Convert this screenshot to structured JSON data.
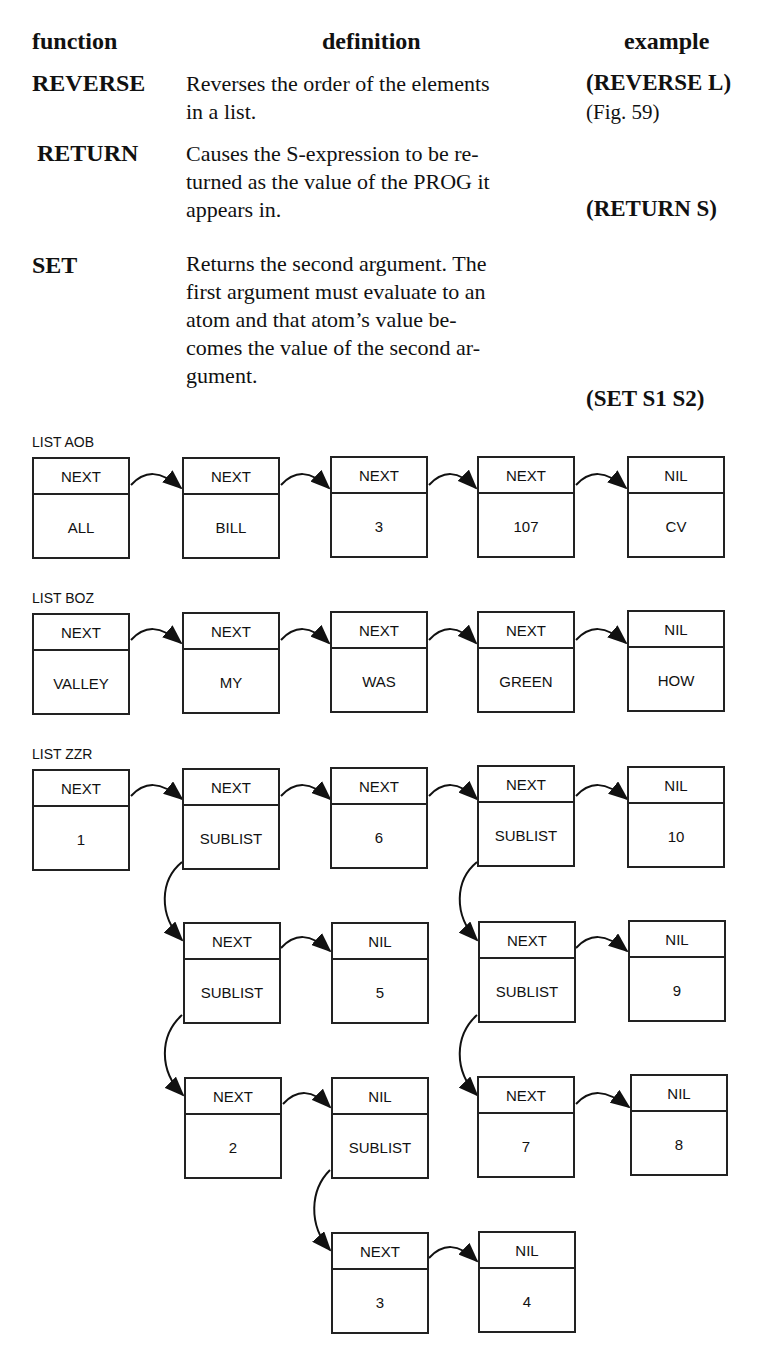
{
  "table": {
    "headers": {
      "function": "function",
      "definition": "definition",
      "example": "example"
    },
    "rows": [
      {
        "function": "REVERSE",
        "definition_lines": [
          "Reverses the order of the elements",
          "in a list."
        ],
        "example": "(REVERSE L)",
        "note": "(Fig. 59)"
      },
      {
        "function": "RETURN",
        "definition_lines": [
          "Causes the S-expression to be re-",
          "turned as the value of the PROG it",
          "appears in."
        ],
        "example": "(RETURN S)"
      },
      {
        "function": "SET",
        "definition_lines": [
          "Returns the second argument. The",
          "first argument must evaluate to an",
          "atom and that atom’s value be-",
          "comes the value of the second ar-",
          "gument."
        ],
        "example": "(SET S1 S2)"
      }
    ]
  },
  "diagram": {
    "lists": [
      {
        "label": "LIST AOB",
        "nodes": [
          {
            "ptr": "NEXT",
            "val": "ALL"
          },
          {
            "ptr": "NEXT",
            "val": "BILL"
          },
          {
            "ptr": "NEXT",
            "val": "3"
          },
          {
            "ptr": "NEXT",
            "val": "107"
          },
          {
            "ptr": "NIL",
            "val": "CV"
          }
        ]
      },
      {
        "label": "LIST BOZ",
        "nodes": [
          {
            "ptr": "NEXT",
            "val": "VALLEY"
          },
          {
            "ptr": "NEXT",
            "val": "MY"
          },
          {
            "ptr": "NEXT",
            "val": "WAS"
          },
          {
            "ptr": "NEXT",
            "val": "GREEN"
          },
          {
            "ptr": "NIL",
            "val": "HOW"
          }
        ]
      },
      {
        "label": "LIST ZZR",
        "nodes": [
          {
            "ptr": "NEXT",
            "val": "1"
          },
          {
            "ptr": "NEXT",
            "val": "SUBLIST"
          },
          {
            "ptr": "NEXT",
            "val": "6"
          },
          {
            "ptr": "NEXT",
            "val": "SUBLIST"
          },
          {
            "ptr": "NIL",
            "val": "10"
          }
        ]
      }
    ],
    "sublists": {
      "a": [
        {
          "ptr": "NEXT",
          "val": "SUBLIST"
        },
        {
          "ptr": "NIL",
          "val": "5"
        }
      ],
      "b": [
        {
          "ptr": "NEXT",
          "val": "SUBLIST"
        },
        {
          "ptr": "NIL",
          "val": "9"
        }
      ],
      "c": [
        {
          "ptr": "NEXT",
          "val": "2"
        },
        {
          "ptr": "NIL",
          "val": "SUBLIST"
        }
      ],
      "d": [
        {
          "ptr": "NEXT",
          "val": "7"
        },
        {
          "ptr": "NIL",
          "val": "8"
        }
      ],
      "e": [
        {
          "ptr": "NEXT",
          "val": "3"
        },
        {
          "ptr": "NIL",
          "val": "4"
        }
      ]
    }
  }
}
